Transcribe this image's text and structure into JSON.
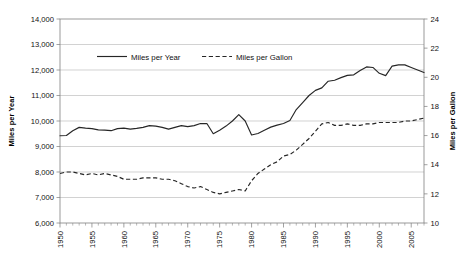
{
  "chart_data": {
    "type": "line",
    "title": "",
    "subtitle": "",
    "xlabel": "",
    "ylabel": "Miles per Year",
    "y2label": "Miles per Gallon",
    "grid": true,
    "legend_position": "top-center",
    "xlim": [
      1950,
      2007
    ],
    "ylim": [
      6000,
      14000
    ],
    "y2lim": [
      10,
      24
    ],
    "x_tick_labels": [
      "1950",
      "1955",
      "1960",
      "1965",
      "1970",
      "1975",
      "1980",
      "1985",
      "1990",
      "1995",
      "2000",
      "2005"
    ],
    "x_tick_values": [
      1950,
      1955,
      1960,
      1965,
      1970,
      1975,
      1980,
      1985,
      1990,
      1995,
      2000,
      2005
    ],
    "x_minor_tick_interval": 1,
    "y_tick_labels": [
      "6,000",
      "7,000",
      "8,000",
      "9,000",
      "10,000",
      "11,000",
      "12,000",
      "13,000",
      "14,000"
    ],
    "y_tick_values": [
      6000,
      7000,
      8000,
      9000,
      10000,
      11000,
      12000,
      13000,
      14000
    ],
    "y2_tick_labels": [
      "10",
      "12",
      "14",
      "16",
      "18",
      "20",
      "22",
      "24"
    ],
    "y2_tick_values": [
      10,
      12,
      14,
      16,
      18,
      20,
      22,
      24
    ],
    "x": [
      1950,
      1951,
      1952,
      1953,
      1954,
      1955,
      1956,
      1957,
      1958,
      1959,
      1960,
      1961,
      1962,
      1963,
      1964,
      1965,
      1966,
      1967,
      1968,
      1969,
      1970,
      1971,
      1972,
      1973,
      1974,
      1975,
      1976,
      1977,
      1978,
      1979,
      1980,
      1981,
      1982,
      1983,
      1984,
      1985,
      1986,
      1987,
      1988,
      1989,
      1990,
      1991,
      1992,
      1993,
      1994,
      1995,
      1996,
      1997,
      1998,
      1999,
      2000,
      2001,
      2002,
      2003,
      2004,
      2005,
      2006,
      2007
    ],
    "series": [
      {
        "name": "Miles per Year",
        "axis": "left",
        "style": "solid",
        "color": "#262626",
        "values": [
          9420,
          9430,
          9620,
          9750,
          9720,
          9700,
          9650,
          9640,
          9620,
          9700,
          9720,
          9680,
          9710,
          9750,
          9820,
          9800,
          9750,
          9680,
          9750,
          9820,
          9780,
          9820,
          9900,
          9900,
          9500,
          9640,
          9800,
          10000,
          10250,
          10000,
          9450,
          9510,
          9640,
          9760,
          9840,
          9900,
          10020,
          10450,
          10720,
          11000,
          11200,
          11300,
          11560,
          11600,
          11700,
          11790,
          11810,
          11980,
          12120,
          12100,
          11870,
          11780,
          12150,
          12200,
          12200,
          12100,
          12000,
          11900
        ]
      },
      {
        "name": "Miles per Gallon",
        "axis": "right",
        "style": "dashed",
        "color": "#262626",
        "values": [
          13.4,
          13.5,
          13.5,
          13.4,
          13.3,
          13.4,
          13.3,
          13.4,
          13.3,
          13.2,
          13.0,
          13.0,
          13.0,
          13.1,
          13.1,
          13.1,
          13.0,
          13.0,
          12.9,
          12.7,
          12.5,
          12.4,
          12.5,
          12.3,
          12.1,
          12.0,
          12.1,
          12.2,
          12.3,
          12.2,
          12.9,
          13.4,
          13.7,
          14.0,
          14.2,
          14.6,
          14.7,
          15.0,
          15.4,
          15.8,
          16.3,
          16.8,
          16.9,
          16.7,
          16.7,
          16.8,
          16.7,
          16.7,
          16.8,
          16.8,
          16.9,
          16.9,
          16.9,
          16.9,
          17.0,
          17.0,
          17.1,
          17.2
        ]
      }
    ]
  },
  "legend": {
    "items": [
      {
        "label": "Miles per Year",
        "style": "solid"
      },
      {
        "label": "Miles per Gallon",
        "style": "dashed"
      }
    ]
  },
  "axes": {
    "left_title": "Miles per Year",
    "right_title": "Miles per Gallon"
  }
}
